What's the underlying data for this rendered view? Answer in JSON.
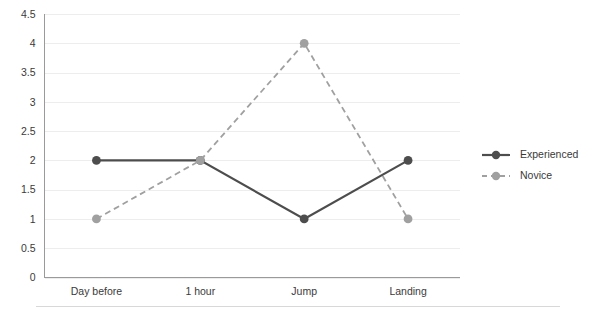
{
  "chart_data": {
    "type": "line",
    "title": "",
    "subtitle": "",
    "xlabel": "",
    "ylabel": "",
    "categories": [
      "Day before",
      "1 hour",
      "Jump",
      "Landing"
    ],
    "series": [
      {
        "name": "Experienced",
        "values": [
          2,
          2,
          1,
          2
        ],
        "color": "#4d4d4d",
        "linestyle": "solid",
        "marker": "circle"
      },
      {
        "name": "Novice",
        "values": [
          1,
          2,
          4,
          1
        ],
        "color": "#a0a0a0",
        "linestyle": "dashed",
        "marker": "circle"
      }
    ],
    "ylim": [
      0,
      4.5
    ],
    "yticks": [
      "0",
      "0.5",
      "1",
      "1.5",
      "2",
      "2.5",
      "3",
      "3.5",
      "4",
      "4.5"
    ],
    "ytick_values": [
      0,
      0.5,
      1,
      1.5,
      2,
      2.5,
      3,
      3.5,
      4,
      4.5
    ],
    "grid": true,
    "grid_axis": "y",
    "legend": {
      "position": "right",
      "entries": [
        {
          "label": "Experienced",
          "color": "#4d4d4d",
          "linestyle": "solid"
        },
        {
          "label": "Novice",
          "color": "#a0a0a0",
          "linestyle": "dashed"
        }
      ]
    },
    "colors": {
      "background": "#ffffff",
      "grid": "#ededed",
      "axis": "#9a9a9a",
      "text": "#3a3a3a",
      "experienced": "#4d4d4d",
      "novice": "#a0a0a0"
    }
  }
}
